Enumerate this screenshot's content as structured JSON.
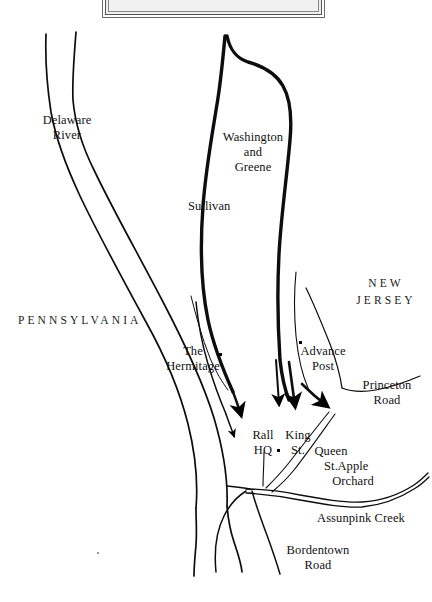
{
  "map": {
    "title_box": {
      "caption": "",
      "fill_color": "#eeeeee",
      "border_color": "#6a6a6a"
    },
    "background_color": "#ffffff",
    "ink_color": "#000000",
    "labels": {
      "delaware_river": {
        "line1": "Delaware",
        "line2": "River"
      },
      "washington_greene": {
        "line1": "Washington",
        "line2": "and",
        "line3": "Greene"
      },
      "sullivan": "Sullivan",
      "pennsylvania": "PENNSYLVANIA",
      "new_jersey": {
        "line1": "NEW",
        "line2": "JERSEY"
      },
      "the_hermitage": {
        "line1": "The",
        "line2": "Hermitage"
      },
      "advance_post": {
        "line1": "Advance",
        "line2": "Post"
      },
      "princeton_road": {
        "line1": "Princeton",
        "line2": "Road"
      },
      "rall_hq": {
        "line1": "Rall",
        "line2": "HQ"
      },
      "king_st": {
        "line1": "King",
        "line2": "St."
      },
      "queen_st": {
        "line1": "Queen",
        "line2": "St."
      },
      "apple_orchard": {
        "line1": "Apple",
        "line2": "Orchard"
      },
      "assunpink_creek": "Assunpink Creek",
      "bordentown_road": {
        "line1": "Bordentown",
        "line2": "Road"
      }
    },
    "markers": [
      {
        "name": "the-hermitage-marker",
        "x": 219,
        "y": 353
      },
      {
        "name": "advance-post-marker",
        "x": 299,
        "y": 341
      },
      {
        "name": "rall-hq-marker",
        "x": 277,
        "y": 449
      }
    ]
  }
}
